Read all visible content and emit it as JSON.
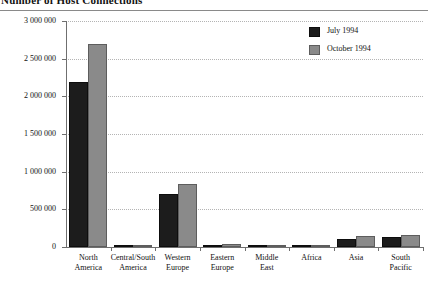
{
  "title": "Number of Host Connections",
  "chart_data": {
    "type": "bar",
    "title": "Number of Host Connections",
    "xlabel": "",
    "ylabel": "",
    "ylim": [
      0,
      3000000
    ],
    "grid": true,
    "legend_position": "top-right",
    "categories": [
      "North America",
      "Central/South America",
      "Western Europe",
      "Eastern Europe",
      "Middle East",
      "Africa",
      "Asia",
      "South Pacific"
    ],
    "category_lines": [
      [
        "North",
        "America"
      ],
      [
        "Central/South",
        "America"
      ],
      [
        "Western",
        "Europe"
      ],
      [
        "Eastern",
        "Europe"
      ],
      [
        "Middle",
        "East"
      ],
      [
        "Africa",
        ""
      ],
      [
        "Asia",
        ""
      ],
      [
        "South",
        "Pacific"
      ]
    ],
    "series": [
      {
        "name": "July 1994",
        "color": "#1c1c1c",
        "values": [
          2190000,
          22000,
          705000,
          33000,
          9000,
          16000,
          112000,
          130000
        ]
      },
      {
        "name": "October 1994",
        "color": "#8a8a8a",
        "values": [
          2690000,
          30000,
          830000,
          43000,
          12000,
          23000,
          148000,
          160000
        ]
      }
    ],
    "yticks": [
      0,
      500000,
      1000000,
      1500000,
      2000000,
      2500000,
      3000000
    ],
    "ytick_labels": [
      "0",
      "500 000",
      "1 000 000",
      "1 500 000",
      "2 000 000",
      "2 500 000",
      "3 000 000"
    ]
  },
  "legend": {
    "items": [
      {
        "label": "July 1994",
        "color": "#1c1c1c"
      },
      {
        "label": "October 1994",
        "color": "#8a8a8a"
      }
    ]
  }
}
